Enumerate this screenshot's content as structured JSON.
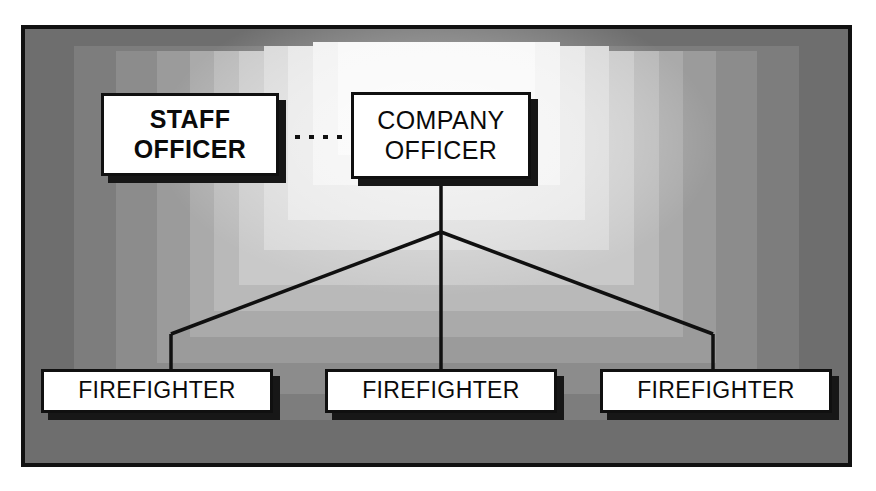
{
  "diagram": {
    "frame_color": "#111111",
    "box_fill": "#ffffff",
    "box_border": "#101010",
    "shadow_color": "#171717",
    "line_color": "#101010",
    "background_edge_color": "#6e6e6e",
    "background_center_color": "#f8f8f8"
  },
  "nodes": {
    "staff_officer": {
      "line1": "STAFF",
      "line2": "OFFICER",
      "weight": "bold"
    },
    "company_officer": {
      "line1": "COMPANY",
      "line2": "OFFICER",
      "weight": "regular"
    },
    "firefighters": [
      {
        "label": "FIREFIGHTER"
      },
      {
        "label": "FIREFIGHTER"
      },
      {
        "label": "FIREFIGHTER"
      }
    ]
  },
  "connectors": {
    "staff_to_company": {
      "style": "dotted",
      "description": "lateral coordination link"
    },
    "company_to_firefighters": {
      "style": "solid",
      "description": "direct supervision lines"
    }
  }
}
